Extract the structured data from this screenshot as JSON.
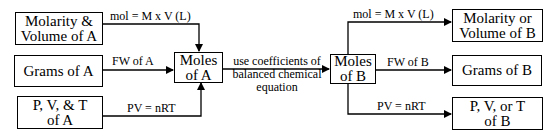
{
  "diagram": {
    "left_boxes": [
      {
        "id": "molarity-volume-a",
        "label": "Molarity &\nVolume of A"
      },
      {
        "id": "grams-a",
        "label": "Grams of A"
      },
      {
        "id": "pvt-a",
        "label": "P, V, & T\nof A"
      }
    ],
    "left_edges": [
      {
        "from": "molarity-volume-a",
        "to": "moles-a",
        "label": "mol = M  x  V (L)"
      },
      {
        "from": "grams-a",
        "to": "moles-a",
        "label": "FW of A"
      },
      {
        "from": "pvt-a",
        "to": "moles-a",
        "label": "PV = nRT"
      }
    ],
    "moles_a": {
      "label": "Moles\nof A"
    },
    "center_edge": {
      "label": "use coefficients of\nbalanced chemical\nequation"
    },
    "moles_b": {
      "label": "Moles\nof B"
    },
    "right_edges": [
      {
        "from": "moles-b",
        "to": "molarity-volume-b",
        "label": "mol = M  x  V (L)"
      },
      {
        "from": "moles-b",
        "to": "grams-b",
        "label": "FW of B"
      },
      {
        "from": "moles-b",
        "to": "pvt-b",
        "label": "PV = nRT"
      }
    ],
    "right_boxes": [
      {
        "id": "molarity-volume-b",
        "label": "Molarity or\nVolume of B"
      },
      {
        "id": "grams-b",
        "label": "Grams of B"
      },
      {
        "id": "pvt-b",
        "label": "P, V, or T\nof B"
      }
    ]
  }
}
